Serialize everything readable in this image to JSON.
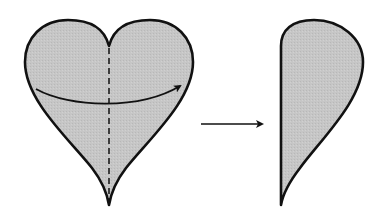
{
  "diagram": {
    "colors": {
      "fill": "#c4c4c4",
      "stroke": "#111111",
      "background": "#ffffff"
    },
    "elements": [
      {
        "id": "full-heart",
        "shape": "heart",
        "fold_line": "vertical-dashed"
      },
      {
        "id": "fold-arrow",
        "shape": "curved-arrow",
        "direction": "left-to-right"
      },
      {
        "id": "transition-arrow",
        "shape": "straight-arrow",
        "direction": "right"
      },
      {
        "id": "half-heart",
        "shape": "half-heart"
      }
    ]
  }
}
